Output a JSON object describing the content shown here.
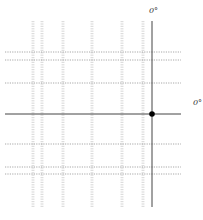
{
  "diagram": {
    "type": "coordinate-grid",
    "colors": {
      "background": "#ffffff",
      "grid": "#9a9a9a",
      "axis": "#444444",
      "point": "#000000",
      "label": "#333333"
    },
    "axes": {
      "vertical": {
        "x": 152,
        "y_start": 21,
        "y_end": 207,
        "label": "0°",
        "label_x": 149,
        "label_y": 7
      },
      "horizontal": {
        "y": 114,
        "x_start": 5,
        "x_end": 181,
        "label": "0°",
        "label_x": 193,
        "label_y": 99
      }
    },
    "grid": {
      "vertical_lines_x": [
        33,
        42,
        63,
        92,
        122,
        143
      ],
      "vertical_y_range": [
        21,
        207
      ],
      "horizontal_lines_y": [
        52,
        60,
        83,
        144,
        167,
        174
      ],
      "horizontal_x_range": [
        5,
        181
      ]
    },
    "origin_point": {
      "x": 152,
      "y": 114,
      "r": 2.8
    }
  }
}
